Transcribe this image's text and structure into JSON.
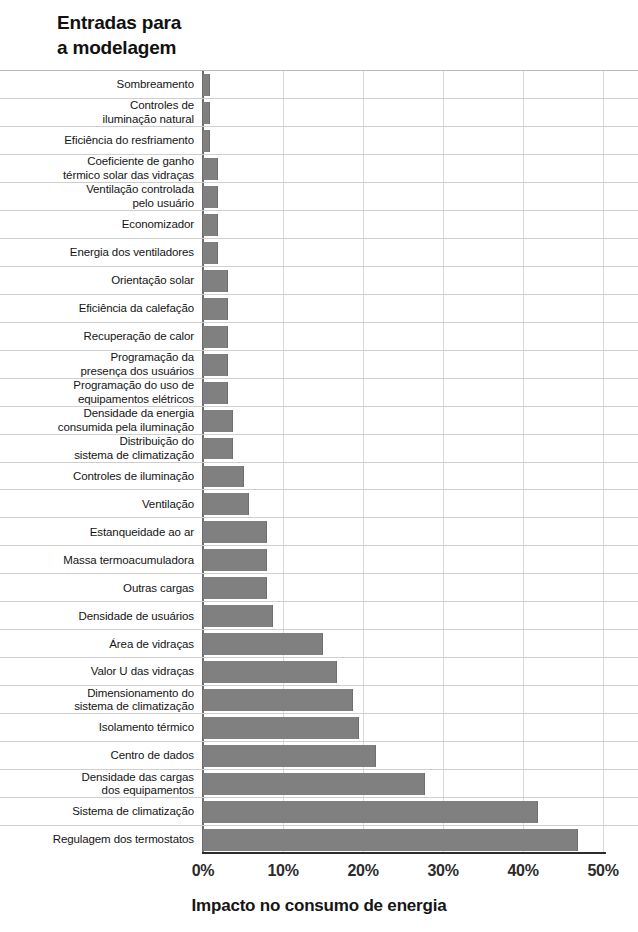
{
  "chart_data": {
    "type": "bar",
    "orientation": "horizontal",
    "title": "Entradas para\na modelagem",
    "xlabel": "Impacto no consumo de energia",
    "ylabel": "Entradas para a modelagem",
    "xlim": [
      0,
      50
    ],
    "xtick_labels": [
      "0%",
      "10%",
      "20%",
      "30%",
      "40%",
      "50%"
    ],
    "xticks": [
      0,
      10,
      20,
      30,
      40,
      50
    ],
    "grid": "vertical",
    "legend": null,
    "bar_color": "#808080",
    "categories": [
      "Sombreamento",
      "Controles de\niluminação natural",
      "Eficiência do resfriamento",
      "Coeficiente de ganho\ntérmico solar das vidraças",
      "Ventilação controlada\npelo usuário",
      "Economizador",
      "Energia dos ventiladores",
      "Orientação solar",
      "Eficiência da calefação",
      "Recuperação de calor",
      "Programação da\npresença dos usuários",
      "Programação do uso de\nequipamentos elétricos",
      "Densidade da energia\nconsumida pela iluminação",
      "Distribuição do\nsistema de climatização",
      "Controles de iluminação",
      "Ventilação",
      "Estanqueidade ao ar",
      "Massa termoacumuladora",
      "Outras cargas",
      "Densidade de usuários",
      "Área de vidraças",
      "Valor U das vidraças",
      "Dimensionamento do\nsistema de climatização",
      "Isolamento térmico",
      "Centro de dados",
      "Densidade das cargas\ndos equipamentos",
      "Sistema de climatização",
      "Regulagem dos termostatos"
    ],
    "values": [
      0.9,
      0.9,
      0.9,
      1.9,
      1.9,
      1.9,
      1.9,
      3.1,
      3.1,
      3.1,
      3.1,
      3.1,
      3.8,
      3.8,
      5.1,
      5.7,
      8.0,
      8.0,
      8.0,
      8.7,
      15.0,
      16.8,
      18.8,
      19.5,
      21.6,
      27.8,
      41.9,
      46.9
    ]
  }
}
